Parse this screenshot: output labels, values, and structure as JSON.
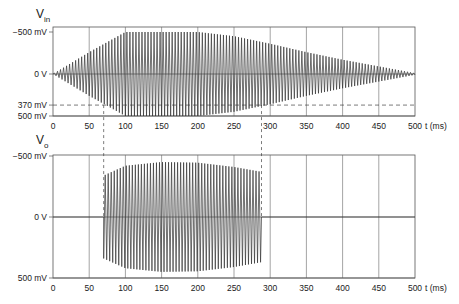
{
  "chart_data": [
    {
      "type": "line",
      "title": "V",
      "title_sub": "in",
      "xlabel": "t (ms)",
      "ylabel": "",
      "xlim": [
        0,
        500
      ],
      "ylim": [
        -500,
        500
      ],
      "x_ticks": [
        "0",
        "50",
        "100",
        "150",
        "200",
        "250",
        "300",
        "350",
        "400",
        "450",
        "500"
      ],
      "y_ticks": [
        {
          "value": 500,
          "label": "500 mV"
        },
        {
          "value": 370,
          "label": "370 mV"
        },
        {
          "value": 0,
          "label": "0 V"
        },
        {
          "value": -500,
          "label": "−500 mV"
        }
      ],
      "grid": true,
      "annotations": [
        {
          "type": "dashed-hline",
          "y": 370,
          "label": "370 mV"
        }
      ],
      "series": [
        {
          "name": "Vin",
          "kind": "amplitude-modulated sine",
          "envelope_x": [
            0,
            50,
            100,
            150,
            200,
            250,
            300,
            350,
            400,
            450,
            500
          ],
          "envelope_y": [
            0,
            260,
            500,
            500,
            500,
            450,
            360,
            260,
            170,
            90,
            10
          ],
          "cycles": 120
        }
      ]
    },
    {
      "type": "line",
      "title": "V",
      "title_sub": "o",
      "xlabel": "t (ms)",
      "ylabel": "",
      "xlim": [
        0,
        500
      ],
      "ylim": [
        -500,
        500
      ],
      "x_ticks": [
        "0",
        "50",
        "100",
        "150",
        "200",
        "250",
        "300",
        "350",
        "400",
        "450",
        "500"
      ],
      "y_ticks": [
        {
          "value": 500,
          "label": "500 mV"
        },
        {
          "value": 0,
          "label": "0 V"
        },
        {
          "value": -500,
          "label": "−500 mV"
        }
      ],
      "grid": true,
      "annotations": [
        {
          "type": "dashed-vline",
          "x": 70,
          "note": "output turns on when Vin reaches 370 mV"
        },
        {
          "type": "dashed-vline",
          "x": 288,
          "note": "output turns off when Vin drops below 370 mV"
        }
      ],
      "series": [
        {
          "name": "Vo",
          "kind": "gated sine",
          "on_ms": 70,
          "off_ms": 288,
          "envelope_x": [
            70,
            100,
            150,
            200,
            250,
            288
          ],
          "envelope_y": [
            340,
            420,
            450,
            445,
            410,
            370
          ],
          "cycles": 120
        }
      ]
    }
  ],
  "labels": {
    "top_title": "V",
    "top_sub": "in",
    "bottom_title": "V",
    "bottom_sub": "o",
    "xunit": "t (ms)"
  }
}
